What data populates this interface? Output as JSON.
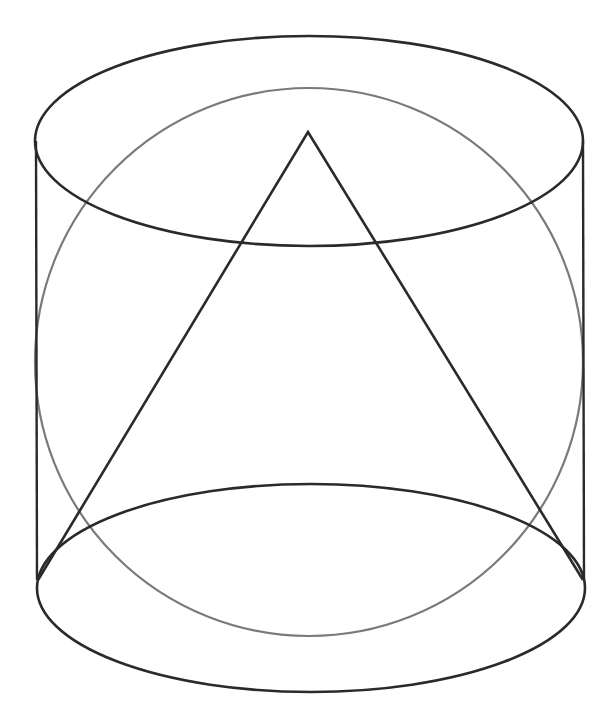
{
  "diagram": {
    "colors": {
      "background": "#ffffff",
      "cylinder": "#2a2a2a",
      "cone": "#2a2a2a",
      "sphere": "#7a7a7a"
    },
    "cylinder": {
      "top_ellipse": {
        "cx": 309,
        "cy": 141,
        "rx": 274,
        "ry": 105
      },
      "bottom_ellipse": {
        "cx": 311,
        "cy": 588,
        "rx": 274,
        "ry": 104
      },
      "left_edge": {
        "x1": 36,
        "y1": 141,
        "x2": 37,
        "y2": 580
      },
      "right_edge": {
        "x1": 583,
        "y1": 141,
        "x2": 584,
        "y2": 580
      }
    },
    "sphere": {
      "cx": 309,
      "cy": 362,
      "r": 274
    },
    "cone": {
      "apex": [
        308,
        132
      ],
      "base_left": [
        38,
        580
      ],
      "base_right": [
        583,
        580
      ]
    }
  }
}
